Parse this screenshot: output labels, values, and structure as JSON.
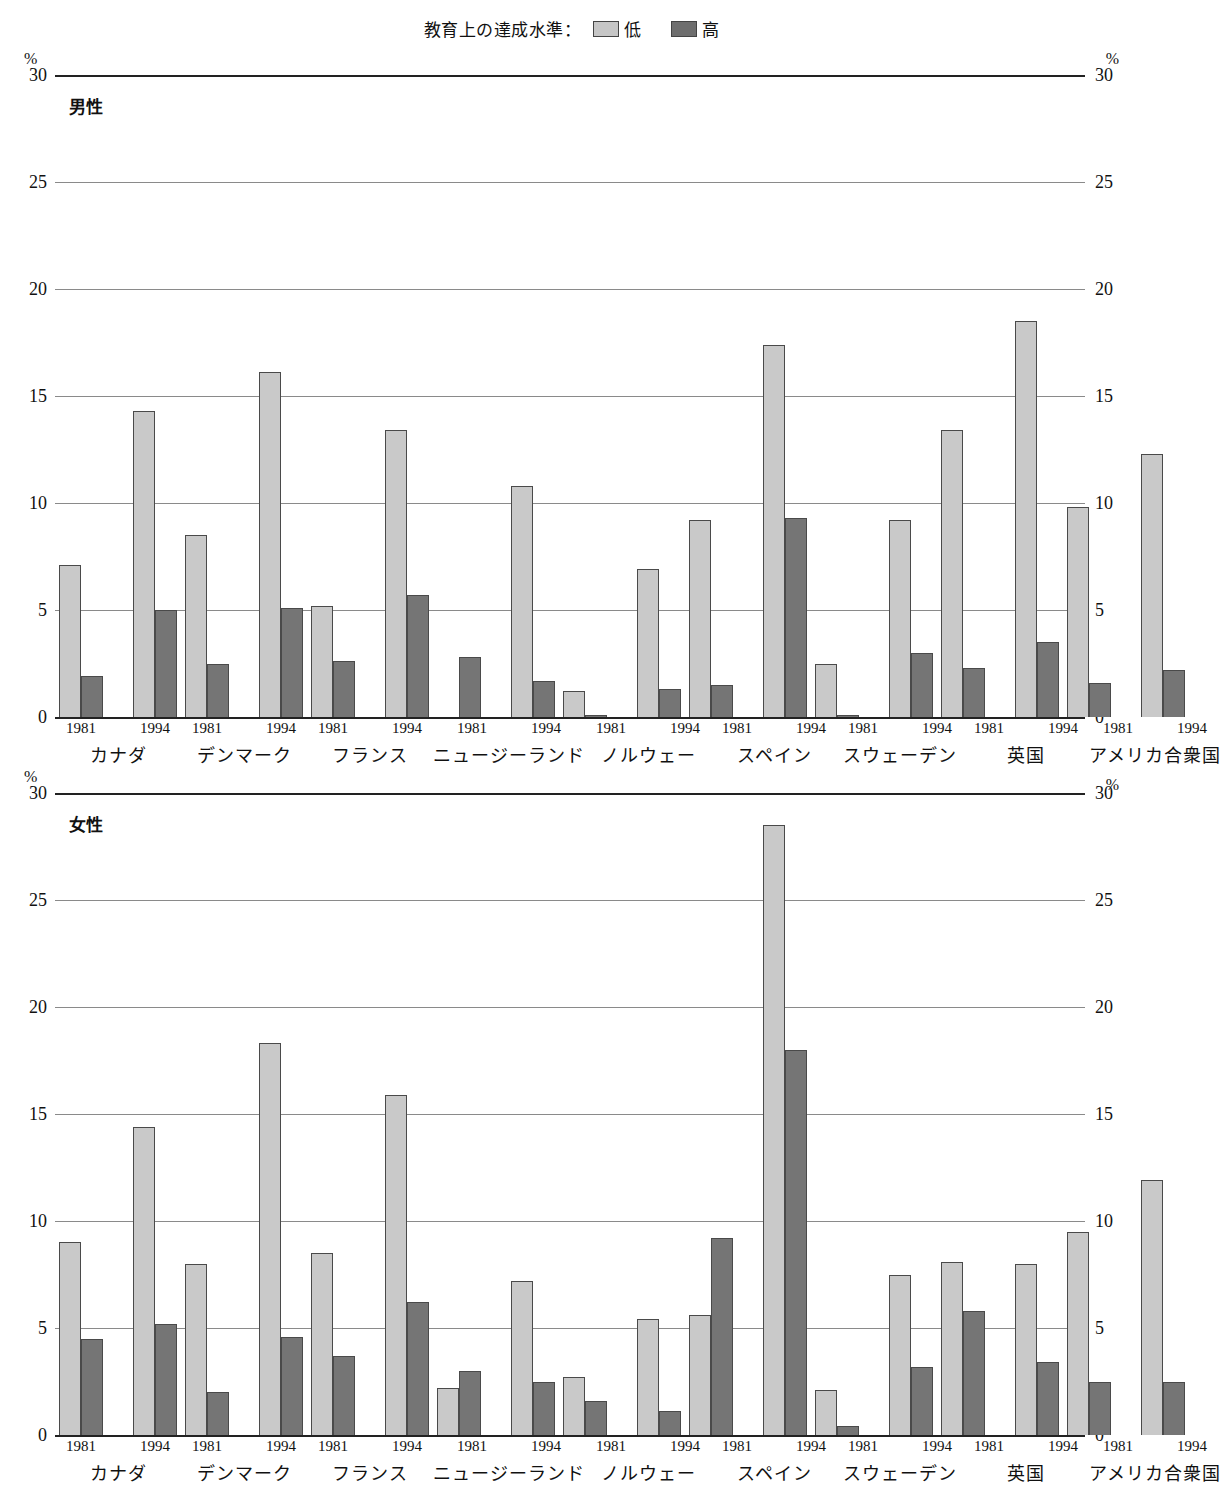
{
  "legend": {
    "title": "教育上の達成水準：",
    "entries": [
      {
        "label": "低",
        "color": "#c9c9c9",
        "key": "low"
      },
      {
        "label": "高",
        "color": "#757575",
        "key": "high"
      }
    ]
  },
  "axis": {
    "unit": "%",
    "ticks": [
      "30",
      "25",
      "20",
      "15",
      "10",
      "5",
      "0"
    ],
    "min": 0,
    "max": 30
  },
  "panels": [
    {
      "caption": "男性"
    },
    {
      "caption": "女性"
    }
  ],
  "years": [
    "1981",
    "1994"
  ],
  "countries": [
    "カナダ",
    "デンマーク",
    "フランス",
    "ニュージーランド",
    "ノルウェー",
    "スペイン",
    "スウェーデン",
    "英国",
    "アメリカ合衆国"
  ],
  "chart_data": [
    {
      "type": "bar",
      "title": "男性",
      "subtitle": "教育上の達成水準：低 / 高",
      "xlabel": "",
      "ylabel": "%",
      "ylim": [
        0,
        30
      ],
      "yticks": [
        0,
        5,
        10,
        15,
        20,
        25,
        30
      ],
      "grid": true,
      "legend_position": "top-center",
      "categories": [
        "カナダ",
        "デンマーク",
        "フランス",
        "ニュージーランド",
        "ノルウェー",
        "スペイン",
        "スウェーデン",
        "英国",
        "アメリカ合衆国"
      ],
      "groups": [
        "1981",
        "1994"
      ],
      "series": [
        {
          "name": "低",
          "values_1981": [
            7.1,
            8.5,
            5.2,
            0.0,
            1.2,
            9.2,
            2.5,
            13.4,
            9.8
          ],
          "values_1994": [
            14.3,
            16.1,
            13.4,
            10.8,
            6.9,
            17.4,
            9.2,
            18.5,
            12.3
          ]
        },
        {
          "name": "高",
          "values_1981": [
            1.9,
            2.5,
            2.6,
            2.8,
            0.1,
            1.5,
            0.1,
            2.3,
            1.6
          ],
          "values_1994": [
            5.0,
            5.1,
            5.7,
            1.7,
            1.3,
            9.3,
            3.0,
            3.5,
            2.2
          ]
        }
      ]
    },
    {
      "type": "bar",
      "title": "女性",
      "subtitle": "教育上の達成水準：低 / 高",
      "xlabel": "",
      "ylabel": "%",
      "ylim": [
        0,
        30
      ],
      "yticks": [
        0,
        5,
        10,
        15,
        20,
        25,
        30
      ],
      "grid": true,
      "legend_position": "top-center",
      "categories": [
        "カナダ",
        "デンマーク",
        "フランス",
        "ニュージーランド",
        "ノルウェー",
        "スペイン",
        "スウェーデン",
        "英国",
        "アメリカ合衆国"
      ],
      "groups": [
        "1981",
        "1994"
      ],
      "series": [
        {
          "name": "低",
          "values_1981": [
            9.0,
            8.0,
            8.5,
            2.2,
            2.7,
            5.6,
            2.1,
            8.1,
            9.5
          ],
          "values_1994": [
            14.4,
            18.3,
            15.9,
            7.2,
            5.4,
            28.5,
            7.5,
            8.0,
            11.9
          ]
        },
        {
          "name": "高",
          "values_1981": [
            4.5,
            2.0,
            3.7,
            3.0,
            1.6,
            9.2,
            0.4,
            5.8,
            2.5
          ],
          "values_1994": [
            5.2,
            4.6,
            6.2,
            2.5,
            1.1,
            18.0,
            3.2,
            3.4,
            2.5
          ]
        }
      ]
    }
  ]
}
